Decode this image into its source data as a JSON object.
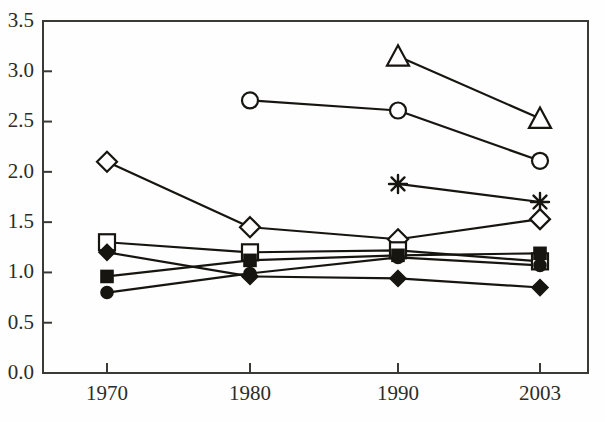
{
  "chart_data": {
    "type": "line",
    "title": "",
    "xlabel": "",
    "ylabel": "",
    "categories": [
      "1970",
      "1980",
      "1990",
      "2003"
    ],
    "ylim": [
      0.0,
      3.5
    ],
    "y_ticks": [
      "0.0",
      "0.5",
      "1.0",
      "1.5",
      "2.0",
      "2.5",
      "3.0",
      "3.5"
    ],
    "x_ticks": [
      "1970",
      "1980",
      "1990",
      "2003"
    ],
    "grid": false,
    "legend": "none",
    "series": [
      {
        "name": "open-triangle",
        "marker": "triangle-open",
        "x": [
          "1990",
          "2003"
        ],
        "values": [
          3.15,
          2.53
        ]
      },
      {
        "name": "open-circle",
        "marker": "circle-open",
        "x": [
          "1980",
          "1990",
          "2003"
        ],
        "values": [
          2.71,
          2.61,
          2.11
        ]
      },
      {
        "name": "asterisk",
        "marker": "asterisk",
        "x": [
          "1990",
          "2003"
        ],
        "values": [
          1.88,
          1.7
        ]
      },
      {
        "name": "open-diamond",
        "marker": "diamond-open",
        "x": [
          "1970",
          "1980",
          "1990",
          "2003"
        ],
        "values": [
          2.1,
          1.45,
          1.33,
          1.53
        ]
      },
      {
        "name": "open-square",
        "marker": "square-open",
        "x": [
          "1970",
          "1980",
          "1990",
          "2003"
        ],
        "values": [
          1.3,
          1.2,
          1.22,
          1.11
        ]
      },
      {
        "name": "filled-diamond",
        "marker": "diamond-filled",
        "x": [
          "1970",
          "1980",
          "1990",
          "2003"
        ],
        "values": [
          1.2,
          0.96,
          0.94,
          0.85
        ]
      },
      {
        "name": "filled-square",
        "marker": "square-filled",
        "x": [
          "1970",
          "1980",
          "1990",
          "2003"
        ],
        "values": [
          0.96,
          1.12,
          1.17,
          1.19
        ]
      },
      {
        "name": "filled-circle",
        "marker": "circle-filled",
        "x": [
          "1970",
          "1980",
          "1990",
          "2003"
        ],
        "values": [
          0.8,
          0.99,
          1.15,
          1.07
        ]
      }
    ],
    "colors": {
      "line": "#17150f",
      "axis": "#3a3a36",
      "marker_fill_open": "#fefefe",
      "marker_fill_solid": "#17150f",
      "background": "#fefefe",
      "tick_label": "#2c2c28"
    }
  }
}
